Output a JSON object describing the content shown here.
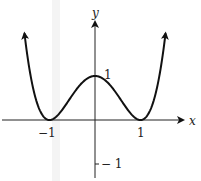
{
  "chart_data": {
    "type": "line",
    "title": "",
    "function": "y = (x^2 - 1)^2",
    "xlabel": "x",
    "ylabel": "y",
    "x_ticks": [
      {
        "value": -1,
        "label": "−1"
      },
      {
        "value": 1,
        "label": "1"
      }
    ],
    "y_ticks": [
      {
        "value": 1,
        "label": "1"
      },
      {
        "value": -1,
        "label": "− 1"
      }
    ],
    "series": [
      {
        "name": "curve",
        "x": [
          -1.55,
          -1.25,
          -1.0,
          -0.75,
          -0.5,
          -0.25,
          0,
          0.25,
          0.5,
          0.75,
          1.0,
          1.25,
          1.55
        ],
        "y": [
          1.97,
          0.32,
          0,
          0.19,
          0.56,
          0.88,
          1,
          0.88,
          0.56,
          0.19,
          0,
          0.32,
          1.97
        ]
      }
    ],
    "xlim": [
      -2.0,
      2.3
    ],
    "ylim": [
      -1.3,
      2.5
    ],
    "grid": false,
    "legend": "none",
    "annotations": [
      "arrowheads at both curve ends",
      "arrowheads on positive x and y axes"
    ]
  },
  "axes": {
    "x_label": "x",
    "y_label": "y",
    "x_tick_neg1": "−1",
    "x_tick_1": "1",
    "y_tick_1": "1",
    "y_tick_neg1": "− 1"
  }
}
